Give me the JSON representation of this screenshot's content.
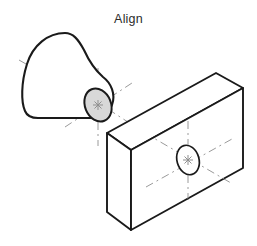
{
  "title": {
    "text": "Align"
  },
  "canvas": {
    "width": 257,
    "height": 246,
    "background": "#ffffff"
  },
  "colors": {
    "outline": "#1a1a1a",
    "centerline": "#9a9a9a",
    "shaded_face_fill": "#d8d8d8",
    "hole_fill": "#ffffff",
    "title_text": "#2b2b2b"
  },
  "shapes": {
    "freeform_solid": {
      "label": "free-form solid",
      "outline_path": "M 65 33 C 44 34, 30 48, 25 68 C 21 85, 22 103, 26 113 C 28 117, 33 118, 40 118 L 97 118 C 104 116, 110 112, 112 105 C 115 95, 112 84, 104 78 C 96 71, 90 63, 84 52 C 78 41, 73 33, 65 33 Z",
      "stroke_width": 2.1
    },
    "shaded_ellipse": {
      "label": "shaded circular end face",
      "cx": 98,
      "cy": 105,
      "rx": 13,
      "ry": 17,
      "rotation_deg": -22,
      "fill": "#d8d8d8",
      "stroke": "#1a1a1a",
      "stroke_width": 2.0
    },
    "block": {
      "label": "isometric rectangular block",
      "front_face": "M 131 150 L 243 88 L 243 168 L 131 230 Z",
      "top_face": "M 131 150 L 107 133 L 216 73 L 243 88 Z",
      "left_face": "M 131 150 L 107 133 L 107 212 L 131 230 Z",
      "stroke_width": 1.9
    },
    "block_hole": {
      "label": "through hole on block face",
      "cx": 188,
      "cy": 160,
      "rx": 11,
      "ry": 15,
      "rotation_deg": -16,
      "fill": "#ffffff",
      "stroke": "#1a1a1a",
      "stroke_width": 1.6
    }
  },
  "centerlines": {
    "solid_axis": {
      "label": "cone axis centerline",
      "x1": 19,
      "y1": 60,
      "x2": 98,
      "y2": 105,
      "dash": "9 4 2 4"
    },
    "solid_vertical": {
      "label": "vertical centerline at shaded face",
      "x1": 98,
      "y1": 68,
      "x2": 98,
      "y2": 146,
      "dash": "8 4 2 4"
    },
    "solid_diag_a": {
      "label": "isometric centerline upper-right",
      "x1": 65,
      "y1": 127,
      "x2": 132,
      "y2": 83,
      "dash": "8 4 2 4"
    },
    "solid_diag_b": {
      "label": "isometric centerline lower-right",
      "x1": 63,
      "y1": 80,
      "x2": 131,
      "y2": 124,
      "dash": "8 4 2 4"
    },
    "block_vertical": {
      "label": "vertical centerline at hole",
      "x1": 188,
      "y1": 121,
      "x2": 188,
      "y2": 200,
      "dash": "8 4 2 4"
    },
    "block_diag_a": {
      "label": "hole isometric centerline up-right",
      "x1": 146,
      "y1": 187,
      "x2": 232,
      "y2": 139,
      "dash": "8 4 2 4"
    },
    "block_diag_b": {
      "label": "hole isometric centerline down-right",
      "x1": 145,
      "y1": 133,
      "x2": 231,
      "y2": 183,
      "dash": "8 4 2 4"
    }
  },
  "center_marks": {
    "solid_face": {
      "cx": 98,
      "cy": 105,
      "size": 5
    },
    "block_hole": {
      "cx": 188,
      "cy": 160,
      "size": 5
    }
  }
}
